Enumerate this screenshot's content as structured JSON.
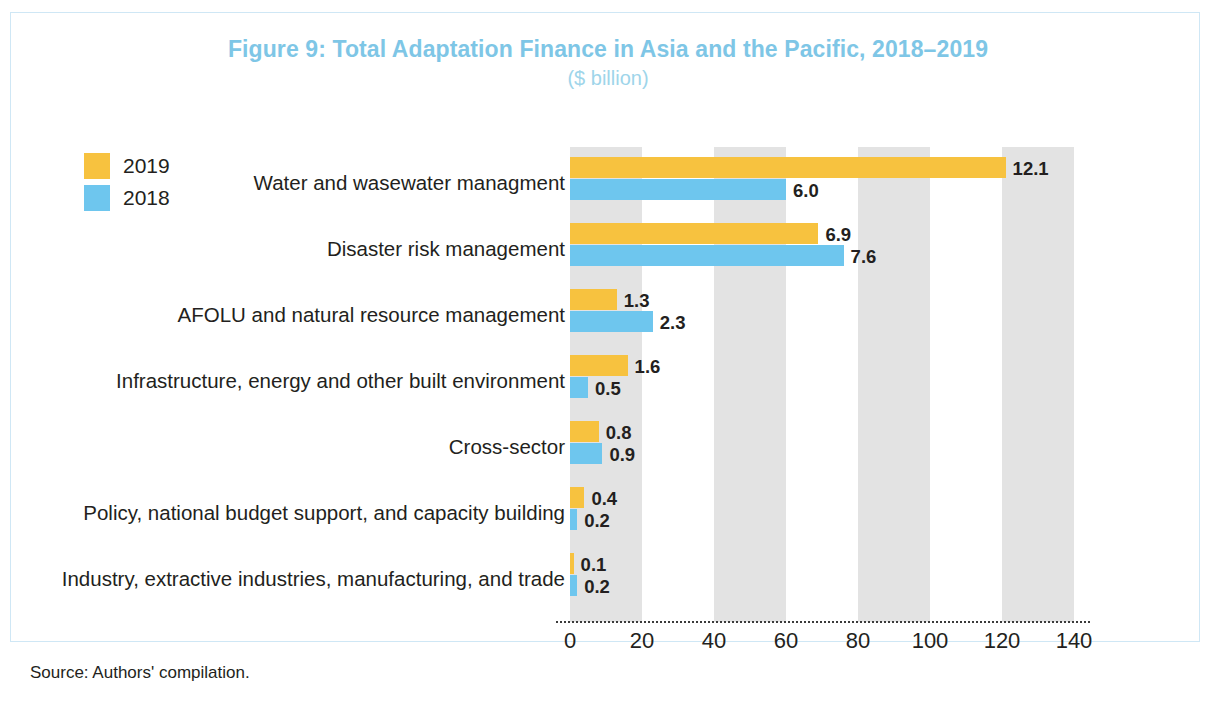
{
  "figure": {
    "title": "Figure 9: Total Adaptation Finance in Asia and the Pacific, 2018–2019",
    "subtitle": "($ billion)",
    "source": "Source: Authors' compilation.",
    "title_color": "#7ec6e6",
    "border_color": "#cfe7f5"
  },
  "legend": {
    "items": [
      {
        "label": "2019",
        "color": "#f7c23f"
      },
      {
        "label": "2018",
        "color": "#6ec6ee"
      }
    ]
  },
  "axis": {
    "ticks": [
      "0",
      "20",
      "40",
      "60",
      "80",
      "100",
      "120",
      "140"
    ]
  },
  "chart_data": {
    "type": "bar",
    "orientation": "horizontal",
    "grouped": true,
    "title": "Figure 9: Total Adaptation Finance in Asia and the Pacific, 2018–2019",
    "subtitle": "($ billion)",
    "xlabel": "",
    "ylabel": "",
    "xlim": [
      0,
      140
    ],
    "xticks": [
      0,
      20,
      40,
      60,
      80,
      100,
      120,
      140
    ],
    "grid": "alternating vertical bands, 20-unit width, grey starting at 0",
    "legend_position": "top-left",
    "bar_pixel_scale_note": "bars drawn at approximately 10x the labelled values on the 0-140 axis",
    "categories": [
      "Water and wasewater managment",
      "Disaster risk management",
      "AFOLU and natural resource management",
      "Infrastructure, energy and other built environment",
      "Cross-sector",
      "Policy, national budget support, and capacity building",
      "Industry, extractive industries, manufacturing, and trade"
    ],
    "series": [
      {
        "name": "2019",
        "color": "#f7c23f",
        "values": [
          12.1,
          6.9,
          1.3,
          1.6,
          0.8,
          0.4,
          0.1
        ],
        "labels": [
          "12.1",
          "6.9",
          "1.3",
          "1.6",
          "0.8",
          "0.4",
          "0.1"
        ]
      },
      {
        "name": "2018",
        "color": "#6ec6ee",
        "values": [
          6.0,
          7.6,
          2.3,
          0.5,
          0.9,
          0.2,
          0.2
        ],
        "labels": [
          "6.0",
          "7.6",
          "2.3",
          "0.5",
          "0.9",
          "0.2",
          "0.2"
        ]
      }
    ]
  }
}
